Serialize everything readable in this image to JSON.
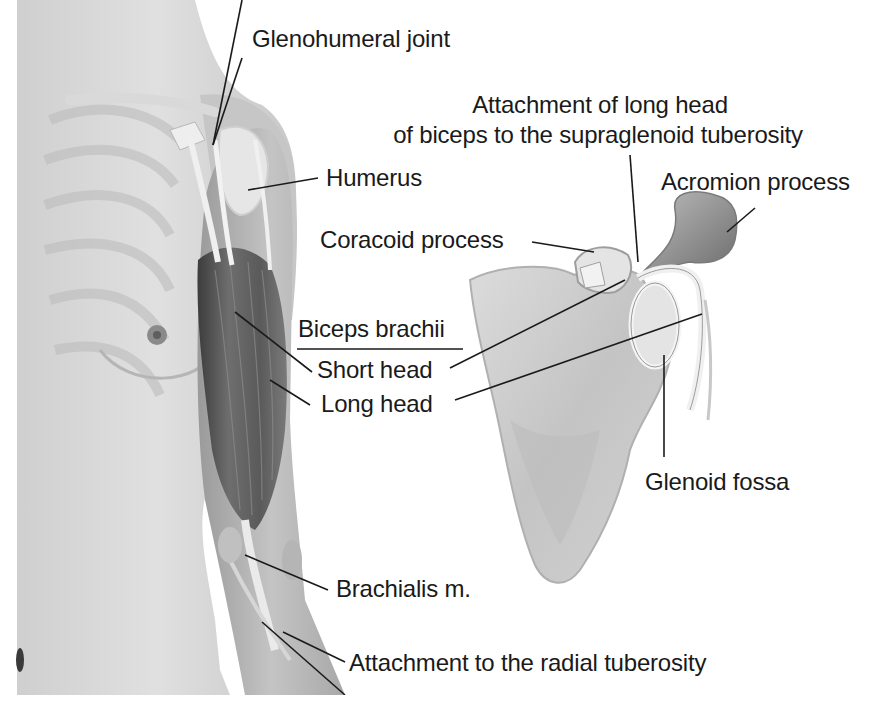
{
  "figure": {
    "palette": {
      "background": "#ffffff",
      "skin_light": "#e2e2e2",
      "skin_mid": "#c9c9c9",
      "muscle_dark": "#5a5a5a",
      "tendon": "#f2f2f2",
      "bone": "#d8d8d8",
      "text": "#1a1a1a",
      "leader_line": "#1a1a1a"
    }
  },
  "labels": {
    "glenohumeral_joint": "Glenohumeral joint",
    "attachment_long_head_line1": "Attachment of long head",
    "attachment_long_head_line2": "of biceps to the supraglenoid tuberosity",
    "humerus": "Humerus",
    "acromion_process": "Acromion process",
    "coracoid_process": "Coracoid process",
    "biceps_brachii": "Biceps brachii",
    "short_head": "Short head",
    "long_head": "Long head",
    "glenoid_fossa": "Glenoid fossa",
    "brachialis": "Brachialis m.",
    "radial_tuberosity": "Attachment to the radial tuberosity"
  }
}
